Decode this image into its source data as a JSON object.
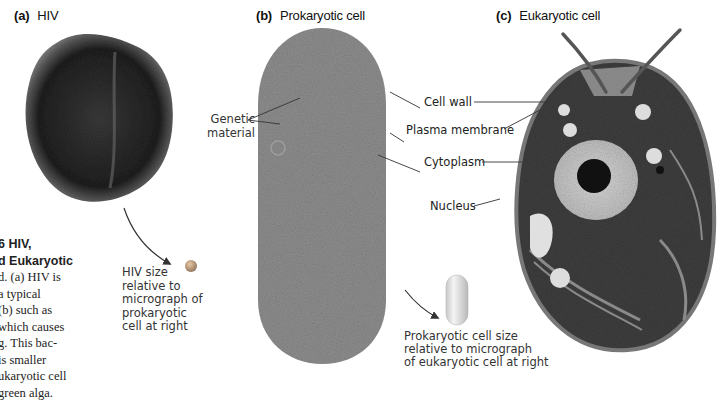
{
  "panels": {
    "a": {
      "letter": "(a)",
      "title": "HIV"
    },
    "b": {
      "letter": "(b)",
      "title": "Prokaryotic cell"
    },
    "c": {
      "letter": "(c)",
      "title": "Eukaryotic cell"
    }
  },
  "labels": {
    "genetic_material": "Genetic\nmaterial",
    "cell_wall": "Cell wall",
    "plasma_membrane": "Plasma membrane",
    "cytoplasm": "Cytoplasm",
    "nucleus": "Nucleus"
  },
  "size_notes": {
    "hiv": "HIV size\nrelative to\nmicrograph of\nprokaryotic\ncell at right",
    "prokaryote": "Prokaryotic cell size\nrelative to micrograph\nof eukaryotic cell at right"
  },
  "caption": {
    "lines": [
      "6    HIV,",
      "d Eukaryotic",
      "d. (a) HIV is",
      " a typical",
      " (b) such as",
      "which causes",
      "g. This bac-",
      " is smaller",
      "ukaryotic cell",
      "green alga."
    ]
  }
}
